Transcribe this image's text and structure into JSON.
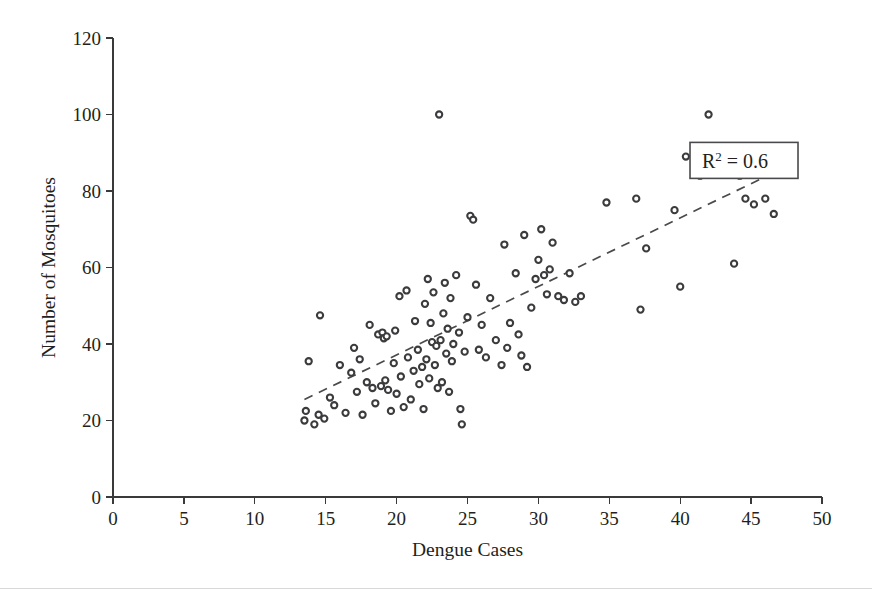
{
  "chart_data": {
    "type": "scatter",
    "title": "",
    "xlabel": "Dengue Cases",
    "ylabel": "Number of Mosquitoes",
    "xlim": [
      0,
      50
    ],
    "ylim": [
      0,
      120
    ],
    "xticks": [
      0,
      5,
      10,
      15,
      20,
      25,
      30,
      35,
      40,
      45,
      50
    ],
    "yticks": [
      0,
      20,
      40,
      60,
      80,
      100,
      120
    ],
    "xtick_labels": [
      "0",
      "5",
      "10",
      "15",
      "20",
      "25",
      "30",
      "35",
      "40",
      "45",
      "50"
    ],
    "ytick_labels": [
      "0",
      "20",
      "40",
      "60",
      "80",
      "100",
      "120"
    ],
    "grid": false,
    "legend": false,
    "marker_style": "open-circle",
    "marker_color": "#3b3b3d",
    "annotations": [
      {
        "name": "r2-annotation",
        "text": "R2 = 0.6",
        "label_prefix": "R",
        "label_exponent": "2",
        "label_suffix": " = 0.6",
        "boxed": true,
        "x": 44.5,
        "y": 88
      }
    ],
    "trendline": {
      "type": "linear-dashed",
      "x_start": 13.5,
      "y_start": 25.5,
      "x_end": 45.6,
      "y_end": 83.0,
      "style": "dashed",
      "color": "#4a4a4c"
    },
    "points": [
      [
        13.5,
        20.0
      ],
      [
        13.6,
        22.5
      ],
      [
        13.8,
        35.5
      ],
      [
        14.2,
        19.0
      ],
      [
        14.5,
        21.5
      ],
      [
        14.6,
        47.5
      ],
      [
        14.9,
        20.5
      ],
      [
        15.3,
        26.0
      ],
      [
        15.6,
        24.0
      ],
      [
        16.0,
        34.5
      ],
      [
        16.4,
        22.0
      ],
      [
        16.8,
        32.5
      ],
      [
        17.0,
        39.0
      ],
      [
        17.2,
        27.5
      ],
      [
        17.4,
        36.0
      ],
      [
        17.6,
        21.5
      ],
      [
        17.9,
        30.0
      ],
      [
        18.1,
        45.0
      ],
      [
        18.3,
        28.5
      ],
      [
        18.5,
        24.5
      ],
      [
        18.7,
        42.5
      ],
      [
        18.9,
        29.0
      ],
      [
        19.0,
        43.0
      ],
      [
        19.1,
        41.5
      ],
      [
        19.2,
        30.5
      ],
      [
        19.3,
        42.0
      ],
      [
        19.4,
        28.0
      ],
      [
        19.6,
        22.5
      ],
      [
        19.8,
        35.0
      ],
      [
        19.9,
        43.5
      ],
      [
        20.0,
        27.0
      ],
      [
        20.2,
        52.5
      ],
      [
        20.3,
        31.5
      ],
      [
        20.5,
        23.5
      ],
      [
        20.7,
        54.0
      ],
      [
        20.8,
        36.5
      ],
      [
        21.0,
        25.5
      ],
      [
        21.2,
        33.0
      ],
      [
        21.3,
        46.0
      ],
      [
        21.5,
        38.5
      ],
      [
        21.6,
        29.5
      ],
      [
        21.8,
        34.0
      ],
      [
        21.9,
        23.0
      ],
      [
        22.0,
        50.5
      ],
      [
        22.1,
        36.0
      ],
      [
        22.2,
        57.0
      ],
      [
        22.3,
        31.0
      ],
      [
        22.4,
        45.5
      ],
      [
        22.5,
        40.5
      ],
      [
        22.6,
        53.5
      ],
      [
        22.7,
        34.5
      ],
      [
        22.8,
        39.5
      ],
      [
        22.9,
        28.5
      ],
      [
        23.0,
        100.0
      ],
      [
        23.1,
        41.0
      ],
      [
        23.2,
        30.0
      ],
      [
        23.3,
        48.0
      ],
      [
        23.4,
        56.0
      ],
      [
        23.5,
        37.5
      ],
      [
        23.6,
        44.0
      ],
      [
        23.7,
        27.5
      ],
      [
        23.8,
        52.0
      ],
      [
        23.9,
        35.5
      ],
      [
        24.0,
        40.0
      ],
      [
        24.2,
        58.0
      ],
      [
        24.4,
        43.0
      ],
      [
        24.5,
        23.0
      ],
      [
        24.6,
        19.0
      ],
      [
        24.8,
        38.0
      ],
      [
        25.0,
        47.0
      ],
      [
        25.2,
        73.5
      ],
      [
        25.4,
        72.5
      ],
      [
        25.6,
        55.5
      ],
      [
        25.8,
        38.5
      ],
      [
        26.0,
        45.0
      ],
      [
        26.3,
        36.5
      ],
      [
        26.6,
        52.0
      ],
      [
        27.0,
        41.0
      ],
      [
        27.4,
        34.5
      ],
      [
        27.6,
        66.0
      ],
      [
        27.8,
        39.0
      ],
      [
        28.0,
        45.5
      ],
      [
        28.4,
        58.5
      ],
      [
        28.6,
        42.5
      ],
      [
        28.8,
        37.0
      ],
      [
        29.0,
        68.5
      ],
      [
        29.2,
        34.0
      ],
      [
        29.5,
        49.5
      ],
      [
        29.8,
        57.0
      ],
      [
        30.0,
        62.0
      ],
      [
        30.2,
        70.0
      ],
      [
        30.4,
        58.0
      ],
      [
        30.6,
        53.0
      ],
      [
        30.8,
        59.5
      ],
      [
        31.0,
        66.5
      ],
      [
        31.4,
        52.5
      ],
      [
        31.8,
        51.5
      ],
      [
        32.2,
        58.5
      ],
      [
        32.6,
        51.0
      ],
      [
        33.0,
        52.5
      ],
      [
        34.8,
        77.0
      ],
      [
        36.9,
        78.0
      ],
      [
        37.2,
        49.0
      ],
      [
        37.6,
        65.0
      ],
      [
        39.6,
        75.0
      ],
      [
        40.0,
        55.0
      ],
      [
        40.4,
        89.0
      ],
      [
        41.0,
        84.5
      ],
      [
        41.4,
        84.0
      ],
      [
        42.0,
        100.0
      ],
      [
        43.8,
        61.0
      ],
      [
        44.2,
        84.0
      ],
      [
        44.6,
        78.0
      ],
      [
        45.2,
        76.5
      ],
      [
        46.0,
        78.0
      ],
      [
        46.6,
        74.0
      ]
    ]
  },
  "colors": {
    "axis": "#3a3a3a",
    "marker_stroke": "#3b3b3d",
    "trendline": "#4a4a4c",
    "text": "#231f20",
    "background": "#ffffff",
    "footer_rule": "#d8d8d8"
  }
}
